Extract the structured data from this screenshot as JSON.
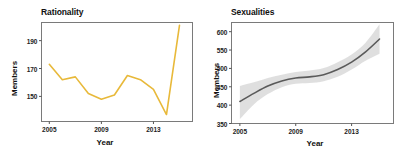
{
  "figure": {
    "background": "#ffffff",
    "width": 407,
    "height": 160
  },
  "panels": [
    {
      "id": "rationality",
      "title": "Rationality",
      "xlabel": "Year",
      "ylabel": "Members"
    },
    {
      "id": "sexualities",
      "title": "Sexualities",
      "xlabel": "Year",
      "ylabel": "Members"
    }
  ],
  "chart_data": [
    {
      "type": "line",
      "title": "Rationality",
      "xlabel": "Year",
      "ylabel": "Members",
      "xlim": [
        2004.4,
        2016.0
      ],
      "ylim": [
        132,
        203
      ],
      "xticks": [
        2005,
        2009,
        2013
      ],
      "xticklabels": [
        "2005",
        "2009",
        "2013"
      ],
      "yticks": [
        150,
        170,
        190
      ],
      "yticklabels": [
        "150",
        "170",
        "190"
      ],
      "grid": false,
      "legend": null,
      "line_color": "#E8B93A",
      "line_width": 1.6,
      "x": [
        2005,
        2006,
        2007,
        2008,
        2009,
        2010,
        2011,
        2012,
        2013,
        2014,
        2015
      ],
      "values": [
        173,
        162,
        164,
        152,
        148,
        151,
        165,
        162,
        155,
        137,
        201
      ],
      "series": [
        {
          "name": "Rationality members",
          "values": [
            173,
            162,
            164,
            152,
            148,
            151,
            165,
            162,
            155,
            137,
            201
          ]
        }
      ]
    },
    {
      "type": "line",
      "title": "Sexualities",
      "xlabel": "Year",
      "ylabel": "Members",
      "xlim": [
        2004.4,
        2016.0
      ],
      "ylim": [
        350,
        625
      ],
      "xticks": [
        2005,
        2009,
        2013
      ],
      "xticklabels": [
        "2005",
        "2009",
        "2013"
      ],
      "yticks": [
        350,
        400,
        450,
        500,
        550,
        600
      ],
      "yticklabels": [
        "350",
        "400",
        "450",
        "500",
        "550",
        "600"
      ],
      "grid": false,
      "legend": null,
      "line_color": "#5A5A5A",
      "line_width": 1.6,
      "band_color": "#D9D9D9",
      "band_opacity": 0.85,
      "x": [
        2005,
        2006,
        2007,
        2008,
        2009,
        2010,
        2011,
        2012,
        2013,
        2014,
        2015
      ],
      "values": [
        410,
        432,
        452,
        466,
        474,
        477,
        483,
        497,
        517,
        545,
        580
      ],
      "band_lower": [
        362,
        402,
        430,
        449,
        458,
        460,
        465,
        477,
        497,
        521,
        540
      ],
      "band_upper": [
        452,
        462,
        474,
        483,
        490,
        494,
        501,
        517,
        538,
        570,
        620
      ],
      "series": [
        {
          "name": "Sexualities members",
          "values": [
            410,
            432,
            452,
            466,
            474,
            477,
            483,
            497,
            517,
            545,
            580
          ]
        }
      ]
    }
  ]
}
